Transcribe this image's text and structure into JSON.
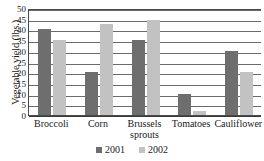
{
  "chart_data": {
    "type": "bar",
    "title": "",
    "xlabel": "",
    "ylabel": "Vegetable yield (lbs.)",
    "categories": [
      "Broccoli",
      "Corn",
      "Brussels\nsprouts",
      "Tomatoes",
      "Cauliflower"
    ],
    "series": [
      {
        "name": "2001",
        "color": "#6e6e6e",
        "values": [
          40,
          20,
          35,
          10,
          30
        ]
      },
      {
        "name": "2002",
        "color": "#c2c2c2",
        "values": [
          35,
          42.5,
          44.5,
          2,
          20
        ]
      }
    ],
    "ylim": [
      0,
      50
    ],
    "yticks": [
      0,
      5,
      10,
      15,
      20,
      25,
      30,
      35,
      40,
      45,
      50
    ],
    "ytick_labels": [
      "0",
      "5",
      "10",
      "15",
      "20",
      "25",
      "30",
      "35",
      "40",
      "45",
      "50"
    ],
    "grid": true,
    "grid_axis": "y",
    "legend_position": "bottom",
    "legend_entries": [
      "2001",
      "2002"
    ]
  }
}
